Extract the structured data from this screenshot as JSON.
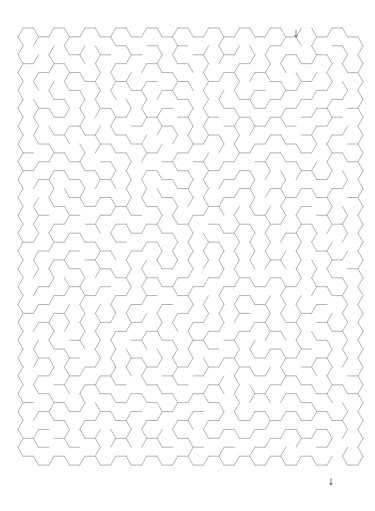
{
  "maze": {
    "type": "hexagonal-maze",
    "columns": 22,
    "rows": 24,
    "edge_length": 10.3,
    "origin_x": 18,
    "origin_y": 28,
    "seed": 73,
    "wall_color": "#b4b4b4",
    "background_color": "#ffffff",
    "entrance": {
      "column": 18,
      "row": 0,
      "side": "top",
      "arrow": "down-arrow",
      "arrow_x": 296,
      "arrow_y": 30
    },
    "exit": {
      "column": 20,
      "row": 23,
      "side": "bottom",
      "arrow": "down-arrow",
      "arrow_x": 331,
      "arrow_y": 478
    },
    "arrow_color": "#8a8a8a"
  }
}
